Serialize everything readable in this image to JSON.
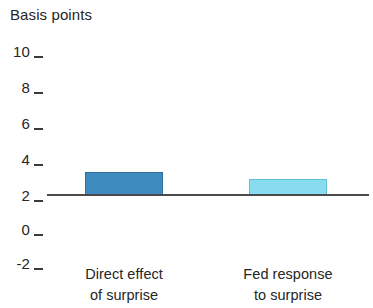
{
  "chart_data": {
    "type": "bar",
    "title": "Basis points",
    "xlabel": "",
    "ylabel": "Basis points",
    "categories": [
      "Direct effect of surprise",
      "Fed response to surprise"
    ],
    "category_lines": [
      [
        "Direct effect",
        "of surprise"
      ],
      [
        "Fed response",
        "to surprise"
      ]
    ],
    "values": [
      1.4,
      1.0
    ],
    "ylim": [
      -2,
      10
    ],
    "yticks": [
      10,
      8,
      6,
      4,
      2,
      0,
      -2
    ],
    "ytick_labels": [
      "10",
      "8",
      "6",
      "4",
      "2",
      "0",
      "-2"
    ],
    "grid": false,
    "legend": "none",
    "bar_colors": [
      "#3e8cbf",
      "#87dcf0"
    ],
    "bar_border_colors": [
      "#2f6f9c",
      "#5fbdd6"
    ],
    "axis_color": "#4a4a4a",
    "background": "#ffffff"
  },
  "axis": {
    "zero_line_name": "zero-baseline"
  }
}
